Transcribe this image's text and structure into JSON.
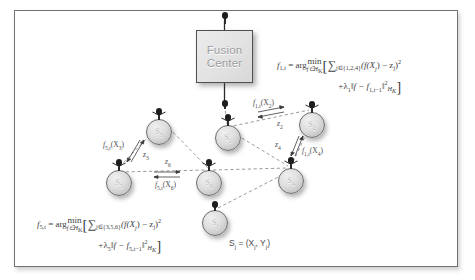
{
  "figure": {
    "fusion_center": {
      "line1": "Fusion",
      "line2": "Center"
    },
    "nodes": [
      {
        "id": "s1",
        "label": "S",
        "sub": "1"
      },
      {
        "id": "s2",
        "label": "S",
        "sub": "2"
      },
      {
        "id": "s3",
        "label": "S",
        "sub": "3"
      },
      {
        "id": "s4",
        "label": "S",
        "sub": "4"
      },
      {
        "id": "s5",
        "label": "S",
        "sub": "5"
      },
      {
        "id": "s6",
        "label": "S",
        "sub": "6"
      }
    ],
    "edge_labels": [
      {
        "id": "f1t_x2",
        "text": "f",
        "sub1": "1,t",
        "tail": "(X",
        "sub2": "2",
        "tail2": ")"
      },
      {
        "id": "z2",
        "text": "z",
        "sub1": "2"
      },
      {
        "id": "z4",
        "text": "z",
        "sub1": "4"
      },
      {
        "id": "f1t_x4",
        "text": "f",
        "sub1": "1,t",
        "tail": "(X",
        "sub2": "4",
        "tail2": ")"
      },
      {
        "id": "f5t_x3",
        "text": "f",
        "sub1": "5,t",
        "tail": "(X",
        "sub2": "3",
        "tail2": ")"
      },
      {
        "id": "z3",
        "text": "z",
        "sub1": "3"
      },
      {
        "id": "z6",
        "text": "z",
        "sub1": "6"
      },
      {
        "id": "f5t_x6",
        "text": "f",
        "sub1": "5,t",
        "tail": "(X",
        "sub2": "6",
        "tail2": ")"
      }
    ],
    "formula_top": {
      "lhs": "f",
      "lhs_sub": "1,t",
      "eq": " = arg",
      "min": "min",
      "min_sub": "f∈H",
      "min_sub2": "K",
      "open": "[",
      "sum": "∑",
      "sum_sub": "j∈{1,2,4}",
      "term": "(f(X",
      "term_sub": "j",
      "term_mid": ") − z",
      "term_sub2": "j",
      "term_end": ")",
      "term_sup": "2",
      "line2_plus": "+λ",
      "line2_sub": "1",
      "line2_norm": "‖f − f",
      "line2_norm_sub": "1,t−1",
      "line2_norm_end": "‖",
      "line2_sup": "2",
      "line2_hsub": "H",
      "line2_hsub2": "K",
      "close": "]"
    },
    "formula_bottom": {
      "lhs": "f",
      "lhs_sub": "5,t",
      "eq": " = arg",
      "min": "min",
      "min_sub": "f∈H",
      "min_sub2": "K",
      "open": "[",
      "sum": "∑",
      "sum_sub": "j∈{3,5,6}",
      "term": "(f(X",
      "term_sub": "j",
      "term_mid": ") − z",
      "term_sub2": "j",
      "term_end": ")",
      "term_sup": "2",
      "line2_plus": "+λ",
      "line2_sub": "5",
      "line2_norm": "‖f − f",
      "line2_norm_sub": "5,t−1",
      "line2_norm_end": "‖",
      "line2_sup": "2",
      "line2_hsub": "H",
      "line2_hsub2": "K",
      "close": "]"
    },
    "legend": {
      "s": "S",
      "s_sub": "j",
      "eq": " = (X",
      "x_sub": "j",
      "comma": ", Y",
      "y_sub": "j",
      "close": ")"
    },
    "colors": {
      "frame_border": "#6f7174",
      "node_fill": "#dedede",
      "node_stroke": "#6a6c6e",
      "antenna": "#1d1d1d",
      "box_fill": "#e6e6e7",
      "box_text": "#9b9da0",
      "edge": "#9a9a9c",
      "text": "#3e3e40",
      "background": "#ffffff"
    }
  }
}
